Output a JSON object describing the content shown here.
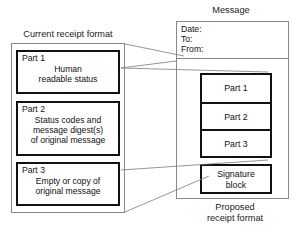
{
  "diagram": {
    "left": {
      "caption": "Current receipt format",
      "parts": [
        {
          "title": "Part 1",
          "body_lines": [
            "Human",
            "readable status"
          ]
        },
        {
          "title": "Part 2",
          "body_lines": [
            "Status codes and",
            "message digest(s)",
            "of original message"
          ]
        },
        {
          "title": "Part 3",
          "body_lines": [
            "Empty or copy of",
            "original message"
          ]
        }
      ]
    },
    "right": {
      "caption": "Message",
      "header_fields": [
        "Date:",
        "To:",
        "From:"
      ],
      "stack_cells": [
        "Part 1",
        "Part 2",
        "Part 3"
      ],
      "signature": {
        "line1": "Signature",
        "line2": "block"
      },
      "footer_caption_line1": "Proposed",
      "footer_caption_line2": "receipt format"
    },
    "colors": {
      "outline_thin": "#888888",
      "outline_thick": "#111111",
      "connector": "#7a7a7a",
      "background": "#ffffff",
      "text": "#111111"
    }
  }
}
